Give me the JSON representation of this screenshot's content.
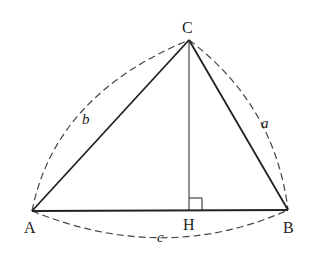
{
  "diagram": {
    "type": "triangle-with-altitude",
    "vertices": [
      {
        "id": "A",
        "label": "A",
        "x": 32,
        "y": 211
      },
      {
        "id": "B",
        "label": "B",
        "x": 288,
        "y": 210
      },
      {
        "id": "C",
        "label": "C",
        "x": 189,
        "y": 40
      }
    ],
    "foot": {
      "id": "H",
      "label": "H",
      "x": 189,
      "y": 211
    },
    "sides": [
      {
        "label": "a",
        "from": "B",
        "to": "C"
      },
      {
        "label": "b",
        "from": "A",
        "to": "C"
      },
      {
        "label": "c",
        "from": "A",
        "to": "B"
      }
    ],
    "altitude": {
      "from": "C",
      "to": "H",
      "right_angle_mark": true
    },
    "colors": {
      "stroke": "#222222",
      "dashed": "#444444",
      "background": "#ffffff"
    }
  }
}
